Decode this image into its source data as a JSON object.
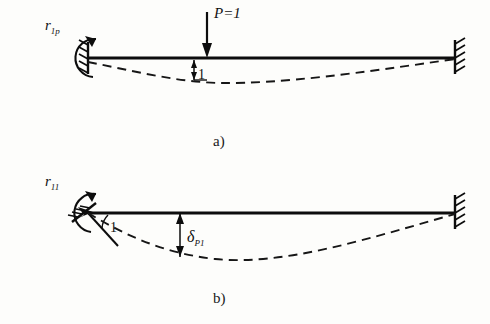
{
  "figure": {
    "background_color": "#fdfdfb",
    "ink_color": "#0d0d0d",
    "panels": [
      {
        "id": "a",
        "caption": "a)",
        "description": "fixed-fixed beam with unit point load",
        "labels": {
          "reaction_moment": {
            "base": "r",
            "subscript": "1p"
          },
          "load": "P=1",
          "unit_displacement": "1"
        },
        "supports": {
          "left": "fixed-support",
          "right": "fixed-support"
        },
        "icons": {
          "moment": "circular-arrow-icon",
          "load": "down-arrow-icon",
          "deflection": "dashed-curve-icon"
        }
      },
      {
        "id": "b",
        "caption": "b)",
        "description": "fixed-fixed beam with unit rotation at left support",
        "labels": {
          "reaction_moment": {
            "base": "r",
            "subscript": "11"
          },
          "unit_rotation": "1",
          "deflection": {
            "base": "δ",
            "subscript": "P1"
          }
        },
        "supports": {
          "left": "fixed-support-rotated",
          "right": "fixed-support"
        },
        "icons": {
          "moment": "circular-arrow-icon",
          "angle": "angle-arc-icon",
          "deflection": "dashed-curve-icon",
          "dimension": "double-arrow-icon"
        }
      }
    ]
  }
}
